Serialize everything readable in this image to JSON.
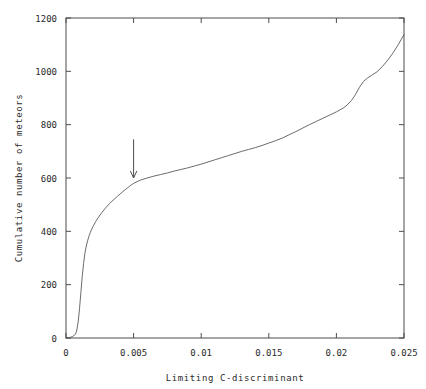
{
  "chart_data": {
    "type": "line",
    "title": "",
    "xlabel": "Limiting C-discriminant",
    "ylabel": "Cumulative number of meteors",
    "xlim": [
      0,
      0.025
    ],
    "ylim": [
      0,
      1200
    ],
    "xticks": [
      0,
      0.005,
      0.01,
      0.015,
      0.02,
      0.025
    ],
    "xticklabels": [
      "0",
      "0.005",
      "0.01",
      "0.015",
      "0.02",
      "0.025"
    ],
    "yticks": [
      0,
      200,
      400,
      600,
      800,
      1000,
      1200
    ],
    "yticklabels": [
      "0",
      "200",
      "400",
      "600",
      "800",
      "1000",
      "1200"
    ],
    "grid": false,
    "legend": null,
    "series": [
      {
        "name": "cumulative-meteor-count",
        "color": "#5a5a5a",
        "x": [
          0.0,
          0.0003,
          0.0005,
          0.0007,
          0.0008,
          0.0009,
          0.001,
          0.0011,
          0.0012,
          0.0013,
          0.0014,
          0.0015,
          0.0016,
          0.0017,
          0.0018,
          0.0019,
          0.002,
          0.0022,
          0.0024,
          0.0026,
          0.0028,
          0.003,
          0.0032,
          0.0034,
          0.0036,
          0.0038,
          0.004,
          0.0042,
          0.0044,
          0.0046,
          0.0048,
          0.005,
          0.0055,
          0.006,
          0.0065,
          0.007,
          0.0075,
          0.008,
          0.0085,
          0.009,
          0.0095,
          0.01,
          0.0105,
          0.011,
          0.0115,
          0.012,
          0.0125,
          0.013,
          0.0135,
          0.014,
          0.0145,
          0.015,
          0.0155,
          0.016,
          0.0165,
          0.017,
          0.0175,
          0.018,
          0.0185,
          0.019,
          0.0195,
          0.02,
          0.0205,
          0.0208,
          0.0211,
          0.0214,
          0.0217,
          0.022,
          0.0223,
          0.0226,
          0.023,
          0.0234,
          0.0238,
          0.0242,
          0.0246,
          0.025
        ],
        "y": [
          0,
          2,
          6,
          14,
          30,
          60,
          110,
          170,
          230,
          280,
          318,
          345,
          365,
          382,
          396,
          408,
          418,
          437,
          453,
          467,
          480,
          492,
          503,
          513,
          522,
          531,
          540,
          549,
          557,
          565,
          573,
          580,
          592,
          600,
          607,
          613,
          619,
          626,
          632,
          638,
          645,
          652,
          660,
          668,
          676,
          684,
          692,
          700,
          707,
          714,
          722,
          731,
          740,
          750,
          762,
          774,
          787,
          800,
          812,
          824,
          836,
          848,
          862,
          874,
          890,
          912,
          940,
          962,
          975,
          985,
          998,
          1018,
          1042,
          1070,
          1102,
          1138
        ]
      }
    ],
    "annotations": [
      {
        "name": "arrow-marker",
        "kind": "down-arrow",
        "x": 0.005,
        "y_tail": 745,
        "y_head": 600,
        "label": ""
      }
    ]
  }
}
